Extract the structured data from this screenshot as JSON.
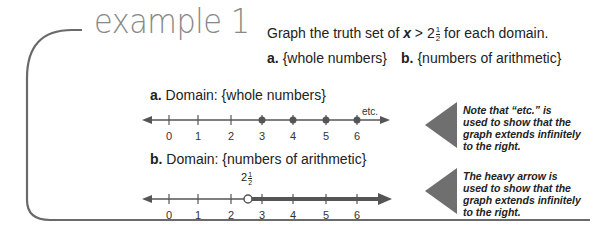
{
  "example": {
    "title": "example 1",
    "instruction": {
      "prefix": "Graph the truth set of ",
      "variable": "x",
      "relation": " > 2",
      "frac_num": "1",
      "frac_den": "2",
      "suffix": " for each domain."
    },
    "parts": [
      {
        "letter": "a.",
        "text": "{whole numbers}"
      },
      {
        "letter": "b.",
        "text": "{numbers of arithmetic}"
      }
    ]
  },
  "graphs": [
    {
      "letter": "a.",
      "label": "Domain: {whole numbers}",
      "tick_labels": [
        "0",
        "1",
        "2",
        "3",
        "4",
        "5",
        "6"
      ],
      "filled_points": [
        "3",
        "4",
        "5",
        "6"
      ],
      "end_note": "etc.",
      "note": [
        "Note that “etc.” is",
        "used to show that the",
        "graph extends infinitely",
        "to the right."
      ]
    },
    {
      "letter": "b.",
      "label": "Domain: {numbers of arithmetic}",
      "tick_labels": [
        "0",
        "1",
        "2",
        "3",
        "4",
        "5",
        "6"
      ],
      "open_point": {
        "whole": "2",
        "num": "1",
        "den": "2"
      },
      "note": [
        "The heavy arrow is",
        "used to show that the",
        "graph extends infinitely",
        "to the right."
      ]
    }
  ],
  "colors": {
    "title": "#888888",
    "pointer": "#6f6f6f",
    "line": "#555555",
    "heavy_ray": "#555555"
  }
}
